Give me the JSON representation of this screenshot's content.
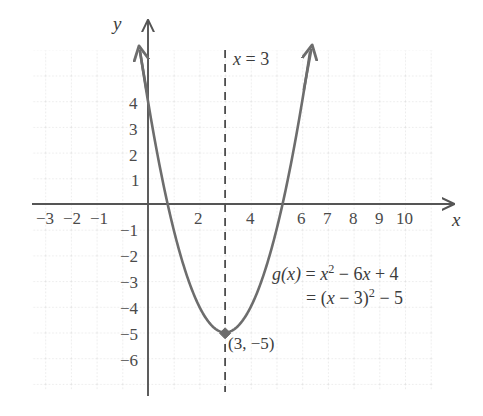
{
  "figure": {
    "kind": "cartesian-parabola-graph",
    "background_color": "#ffffff",
    "grid_color": "#d8d8d8",
    "axis_color": "#555555",
    "curve_color": "#6d6d6d",
    "text_color": "#3c3c3c"
  },
  "axes": {
    "x_name": "x",
    "y_name": "y",
    "x_ticks": [
      {
        "value": -3,
        "label": "−3"
      },
      {
        "value": -2,
        "label": "−2"
      },
      {
        "value": -1,
        "label": "−1"
      },
      {
        "value": 2,
        "label": "2"
      },
      {
        "value": 4,
        "label": "4"
      },
      {
        "value": 6,
        "label": "6"
      },
      {
        "value": 7,
        "label": "7"
      },
      {
        "value": 8,
        "label": "8"
      },
      {
        "value": 9,
        "label": "9"
      },
      {
        "value": 10,
        "label": "10"
      }
    ],
    "y_ticks": [
      {
        "value": 4,
        "label": "4"
      },
      {
        "value": 3,
        "label": "3"
      },
      {
        "value": 2,
        "label": "2"
      },
      {
        "value": 1,
        "label": "1"
      },
      {
        "value": -1,
        "label": "−1"
      },
      {
        "value": -2,
        "label": "−2"
      },
      {
        "value": -3,
        "label": "−3"
      },
      {
        "value": -4,
        "label": "−4"
      },
      {
        "value": -5,
        "label": "−5"
      },
      {
        "value": -6,
        "label": "−6"
      }
    ]
  },
  "annotations": {
    "axis_of_symmetry_label": "x = 3",
    "axis_of_symmetry_label_parts": {
      "var": "x",
      "rest": " = 3"
    },
    "vertex_label": "(3, −5)",
    "equation_line1_parts": {
      "fn": "g",
      "arg": "(x)",
      "eq": " = ",
      "var": "x",
      "exp": "2",
      "tail": " − 6",
      "var2": "x",
      "tail2": " + 4"
    },
    "equation_line2_parts": {
      "eq": "= (",
      "var": "x",
      "mid": " − 3)",
      "exp": "2",
      "tail": " − 5"
    },
    "equation_line1_text": "g(x) = x² − 6x + 4",
    "equation_line2_text": "= (x − 3)² − 5"
  },
  "chart_data": {
    "type": "line",
    "title": "",
    "xlabel": "x",
    "ylabel": "y",
    "function": "g(x) = x^2 - 6x + 4 = (x - 3)^2 - 5",
    "vertex": [
      3,
      -5
    ],
    "axis_of_symmetry": 3,
    "y_intercept": 4,
    "x_intercepts": [
      0.76,
      5.24
    ],
    "xlim": [
      -4.5,
      11.0
    ],
    "ylim": [
      -7.0,
      6.5
    ],
    "grid": true,
    "legend": "none",
    "x": [
      0.05,
      0.5,
      1,
      1.5,
      2,
      2.5,
      3,
      3.5,
      4,
      4.5,
      5,
      5.5,
      5.95
    ],
    "y": [
      0.72,
      -2.75,
      -1,
      -2.75,
      -4,
      -4.75,
      -5,
      -4.75,
      -4,
      -2.75,
      -1,
      0.25,
      1.52
    ],
    "series": [
      {
        "name": "g(x)",
        "points": [
          [
            -0.27,
            5.7
          ],
          [
            0,
            4
          ],
          [
            0.5,
            1.75
          ],
          [
            1,
            -1
          ],
          [
            1.5,
            -2.75
          ],
          [
            2,
            -4
          ],
          [
            2.5,
            -4.75
          ],
          [
            3,
            -5
          ],
          [
            3.5,
            -4.75
          ],
          [
            4,
            -4
          ],
          [
            4.5,
            -2.75
          ],
          [
            5,
            -1
          ],
          [
            5.5,
            1.75
          ],
          [
            6.1,
            4.6
          ]
        ]
      }
    ]
  }
}
